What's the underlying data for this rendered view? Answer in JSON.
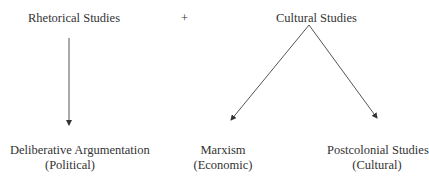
{
  "diagram": {
    "top_left": {
      "label": "Rhetorical Studies"
    },
    "plus": {
      "label": "+"
    },
    "top_right": {
      "label": "Cultural Studies"
    },
    "bottom": [
      {
        "line1": "Deliberative Argumentation",
        "line2": "(Political)"
      },
      {
        "line1": "Marxism",
        "line2": "(Economic)"
      },
      {
        "line1": "Postcolonial Studies",
        "line2": "(Cultural)"
      }
    ],
    "colors": {
      "line": "#444444",
      "text": "#333333"
    }
  }
}
